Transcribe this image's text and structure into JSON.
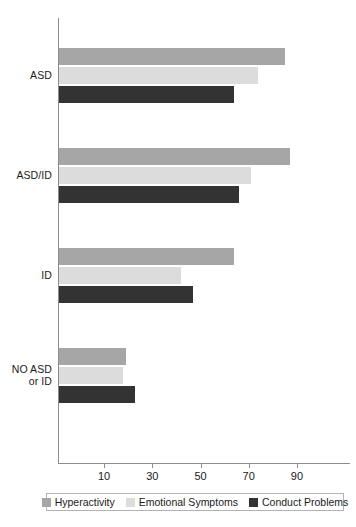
{
  "chart_data": {
    "type": "bar",
    "orientation": "horizontal",
    "title": "",
    "xlabel": "",
    "ylabel": "",
    "categories": [
      "ASD",
      "ASD/ID",
      "ID",
      "NO ASD\nor ID"
    ],
    "series": [
      {
        "name": "Hyperactivity",
        "color": "#a6a6a6",
        "values": [
          85,
          87,
          64,
          19
        ]
      },
      {
        "name": "Emotional Symptoms",
        "color": "#dcdcdc",
        "values": [
          74,
          71,
          42,
          18
        ]
      },
      {
        "name": "Conduct Problems",
        "color": "#333333",
        "values": [
          64,
          66,
          47,
          23
        ]
      }
    ],
    "xticks": [
      10,
      30,
      50,
      70,
      90
    ],
    "xtick_labels": [
      "10",
      "30",
      "50",
      "70",
      "90"
    ],
    "xlim": [
      -9,
      113
    ],
    "grid": false,
    "legend_position": "bottom",
    "axis_color": "#8c8c8c"
  },
  "legend": {
    "items": [
      {
        "label": "Hyperactivity"
      },
      {
        "label": "Emotional Symptoms"
      },
      {
        "label": "Conduct Problems"
      }
    ]
  }
}
